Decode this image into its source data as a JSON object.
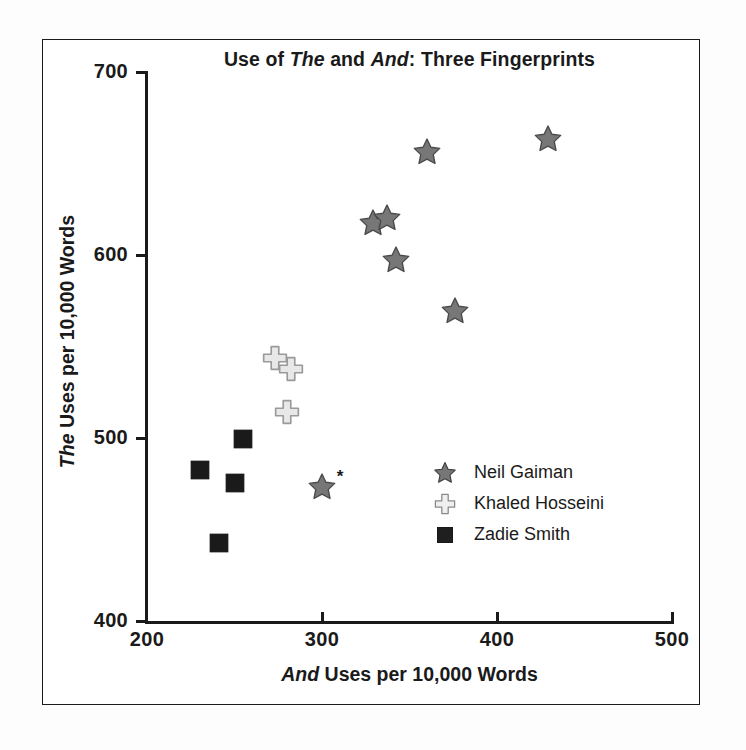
{
  "figure": {
    "background": "#ffffff",
    "frame_color": "#1a1a1a"
  },
  "title_parts": {
    "a": "Use of ",
    "b": "The",
    "c": " and ",
    "d": "And",
    "e": ": Three Fingerprints"
  },
  "xlabel_parts": {
    "a": "And",
    "b": " Uses per 10,000 Words"
  },
  "ylabel_parts": {
    "a": "The",
    "b": " Uses per 10,000 Words"
  },
  "axes": {
    "x_ticks": [
      "200",
      "300",
      "400",
      "500"
    ],
    "y_ticks": [
      "400",
      "500",
      "600",
      "700"
    ]
  },
  "legend": {
    "items": [
      {
        "label": "Neil Gaiman",
        "marker": "star-marker",
        "color": "#777777"
      },
      {
        "label": "Khaled Hosseini",
        "marker": "cross-marker",
        "color": "#e0e0e0"
      },
      {
        "label": "Zadie Smith",
        "marker": "square-marker",
        "color": "#1a1a1a"
      }
    ]
  },
  "annotations": {
    "asterisk": "*"
  },
  "chart_data": {
    "type": "scatter",
    "title": "Use of The and And: Three Fingerprints",
    "xlabel": "And Uses per 10,000 Words",
    "ylabel": "The Uses per 10,000 Words",
    "xlim": [
      200,
      500
    ],
    "ylim": [
      400,
      700
    ],
    "xticks": [
      200,
      300,
      400,
      500
    ],
    "yticks": [
      400,
      500,
      600,
      700
    ],
    "grid": false,
    "legend_position": "center-right",
    "series": [
      {
        "name": "Neil Gaiman",
        "marker": "star",
        "color": "#777777",
        "points": [
          [
            300,
            474
          ],
          [
            329,
            618
          ],
          [
            337,
            621
          ],
          [
            342,
            598
          ],
          [
            360,
            657
          ],
          [
            376,
            570
          ],
          [
            429,
            664
          ]
        ],
        "annotated_point": [
          300,
          474
        ],
        "annotation": "*"
      },
      {
        "name": "Khaled Hosseini",
        "marker": "cross",
        "color": "#e8e8e8",
        "points": [
          [
            273,
            544
          ],
          [
            282,
            538
          ],
          [
            280,
            515
          ]
        ]
      },
      {
        "name": "Zadie Smith",
        "marker": "square",
        "color": "#1a1a1a",
        "points": [
          [
            230,
            483
          ],
          [
            250,
            476
          ],
          [
            255,
            500
          ],
          [
            241,
            443
          ]
        ]
      }
    ]
  }
}
